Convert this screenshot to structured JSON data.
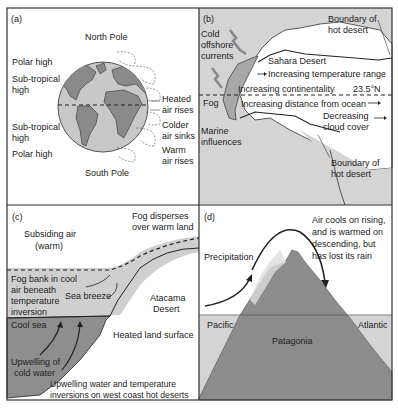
{
  "figure": {
    "panels": [
      {
        "id": "a",
        "tag": "(a)",
        "north": "North Pole",
        "south": "South Pole",
        "left_labels": [
          "Polar high",
          "Sub-tropical",
          "high",
          "Sub-tropical",
          "high",
          "Polar high"
        ],
        "right_labels": [
          "Heated",
          "air rises",
          "Colder",
          "air sinks",
          "Warm",
          "air rises"
        ]
      },
      {
        "id": "b",
        "tag": "(b)",
        "cold_currents": [
          "Cold",
          "offshore",
          "currents"
        ],
        "boundary_top": [
          "Boundary of",
          "hot desert"
        ],
        "sahara": "Sahara Desert",
        "temp_range": "Increasing temperature range",
        "continentality": "Increasing continentality",
        "latitude": "23.5°N",
        "fog": "Fog",
        "distance": "Increasing distance from ocean",
        "cloud": [
          "Decreasing",
          "cloud cover"
        ],
        "marine": [
          "Marine",
          "influences"
        ],
        "boundary_bottom": [
          "Boundary of",
          "hot desert"
        ]
      },
      {
        "id": "c",
        "tag": "(c)",
        "subsiding": [
          "Subsiding air",
          "(warm)"
        ],
        "fog_disperses": [
          "Fog disperses",
          "over warm land"
        ],
        "fog_bank": [
          "Fog bank in cool",
          "air beneath",
          "temperature",
          "inversion"
        ],
        "sea_breeze": "Sea breeze",
        "atacama": [
          "Atacama",
          "Desert"
        ],
        "cool_sea": "Cool sea",
        "heated_land": "Heated land surface",
        "upwelling": [
          "Upwelling of",
          "cold water"
        ],
        "caption": [
          "Upwelling water and temperature",
          "inversions on west coast hot deserts"
        ]
      },
      {
        "id": "d",
        "tag": "(d)",
        "air_cools": [
          "Air cools on rising,",
          "and is warmed on",
          "descending, but",
          "has lost its rain"
        ],
        "precipitation": "Precipitation",
        "pacific": "Pacific",
        "atlantic": "Atlantic",
        "patagonia": "Patagonia"
      }
    ],
    "colors": {
      "land": "#8c8c8c",
      "globe_ocean": "#c8c8c8",
      "sea_light": "#cfcfcf",
      "sea_dark": "#8e8e8e",
      "border": "#333333"
    }
  }
}
